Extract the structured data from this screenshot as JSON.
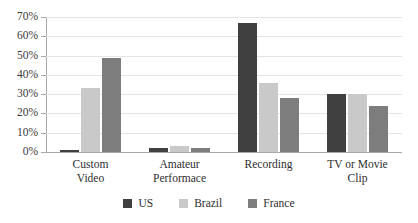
{
  "chart_data": {
    "type": "bar",
    "title": "",
    "subtitle": "",
    "xlabel": "",
    "ylabel": "",
    "ylim": [
      0,
      70
    ],
    "ytick_labels": [
      "70%",
      "60%",
      "50%",
      "40%",
      "30%",
      "20%",
      "10%",
      "0%"
    ],
    "ytick_values": [
      70,
      60,
      50,
      40,
      30,
      20,
      10,
      0
    ],
    "grid": true,
    "legend_position": "bottom",
    "categories": [
      "Custom Video",
      "Amateur Performace",
      "Recording",
      "TV or Movie Clip"
    ],
    "category_lines": [
      [
        "Custom",
        "Video"
      ],
      [
        "Amateur",
        "Performace"
      ],
      [
        "Recording",
        ""
      ],
      [
        "TV or Movie",
        "Clip"
      ]
    ],
    "series": [
      {
        "name": "US",
        "color": "#404040",
        "values": [
          1,
          2,
          67,
          30
        ]
      },
      {
        "name": "Brazil",
        "color": "#c9c9c9",
        "values": [
          33,
          3,
          36,
          30
        ]
      },
      {
        "name": "France",
        "color": "#7d7d7d",
        "values": [
          49,
          2,
          28,
          24
        ]
      }
    ]
  },
  "legend": {
    "items": [
      {
        "label": "US",
        "color": "#404040"
      },
      {
        "label": "Brazil",
        "color": "#c9c9c9"
      },
      {
        "label": "France",
        "color": "#7d7d7d"
      }
    ]
  },
  "colors": {
    "gridline": "#e4e4e4",
    "axis": "#a8a8a8",
    "text": "#2e2e2e",
    "background": "#ffffff"
  }
}
